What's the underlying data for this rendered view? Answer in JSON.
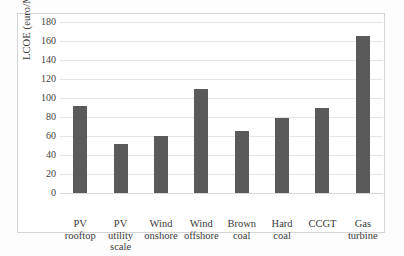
{
  "chart_data": {
    "type": "bar",
    "title": "",
    "xlabel": "",
    "ylabel": "LCOE (euro/MWh)",
    "ylim": [
      0,
      180
    ],
    "ytick_step": 20,
    "grid": true,
    "legend": false,
    "bar_color": "#5a5a5a",
    "categories": [
      "PV\nrooftop",
      "PV\nutility\nscale",
      "Wind\nonshore",
      "Wind\noffshore",
      "Brown\ncoal",
      "Hard\ncoal",
      "CCGT",
      "Gas\nturbine"
    ],
    "values": [
      92,
      52,
      60,
      110,
      65,
      79,
      89,
      165
    ],
    "ytick_labels": [
      "180",
      "160",
      "140",
      "120",
      "100",
      "80",
      "60",
      "40",
      "20",
      "0"
    ]
  }
}
